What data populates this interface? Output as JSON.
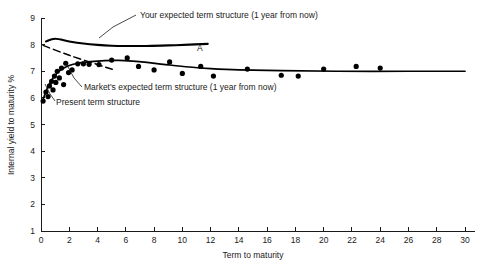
{
  "chart_data": {
    "type": "scatter",
    "title": "",
    "xlabel": "Term to maturity",
    "ylabel": "Internal yield to maturity %",
    "xlim": [
      0,
      30
    ],
    "ylim": [
      1,
      9
    ],
    "xticks": [
      0,
      2,
      4,
      6,
      8,
      10,
      12,
      14,
      16,
      18,
      20,
      22,
      24,
      26,
      28,
      30
    ],
    "yticks": [
      1,
      2,
      3,
      4,
      5,
      6,
      7,
      8,
      9
    ],
    "xtick_labels": [
      "0",
      "2",
      "4",
      "6",
      "8",
      "10",
      "12",
      "14",
      "16",
      "18",
      "20",
      "22",
      "24",
      "26",
      "28",
      "30"
    ],
    "ytick_labels": [
      "1",
      "2",
      "3",
      "4",
      "5",
      "6",
      "7",
      "8",
      "9"
    ],
    "grid": false,
    "legend_position": "inline-annotations",
    "scatter_points": [
      {
        "x": 0.15,
        "y": 5.88
      },
      {
        "x": 0.35,
        "y": 6.22
      },
      {
        "x": 0.5,
        "y": 6.05
      },
      {
        "x": 0.6,
        "y": 6.45
      },
      {
        "x": 0.75,
        "y": 6.62
      },
      {
        "x": 0.85,
        "y": 6.3
      },
      {
        "x": 0.95,
        "y": 6.82
      },
      {
        "x": 1.05,
        "y": 6.58
      },
      {
        "x": 1.15,
        "y": 7.0
      },
      {
        "x": 1.3,
        "y": 6.75
      },
      {
        "x": 1.45,
        "y": 7.12
      },
      {
        "x": 1.6,
        "y": 6.5
      },
      {
        "x": 1.75,
        "y": 7.3
      },
      {
        "x": 1.95,
        "y": 6.95
      },
      {
        "x": 2.2,
        "y": 7.05
      },
      {
        "x": 2.6,
        "y": 7.28
      },
      {
        "x": 3.0,
        "y": 7.28
      },
      {
        "x": 3.4,
        "y": 7.26
      },
      {
        "x": 4.1,
        "y": 7.25
      },
      {
        "x": 5.0,
        "y": 7.42
      },
      {
        "x": 6.1,
        "y": 7.5
      },
      {
        "x": 6.9,
        "y": 7.18
      },
      {
        "x": 8.0,
        "y": 7.05
      },
      {
        "x": 9.1,
        "y": 7.35
      },
      {
        "x": 10.0,
        "y": 6.92
      },
      {
        "x": 11.3,
        "y": 7.18
      },
      {
        "x": 12.2,
        "y": 6.82
      },
      {
        "x": 14.6,
        "y": 7.08
      },
      {
        "x": 17.0,
        "y": 6.85
      },
      {
        "x": 18.2,
        "y": 6.82
      },
      {
        "x": 20.0,
        "y": 7.08
      },
      {
        "x": 22.3,
        "y": 7.18
      },
      {
        "x": 24.0,
        "y": 7.12
      }
    ],
    "curves": [
      {
        "name": "your-expected-term-structure",
        "label": "Your expected term structure (1 year from now)",
        "style": "solid",
        "points": [
          {
            "x": 0.35,
            "y": 8.12
          },
          {
            "x": 1.0,
            "y": 8.22
          },
          {
            "x": 2.0,
            "y": 8.12
          },
          {
            "x": 3.0,
            "y": 8.04
          },
          {
            "x": 4.0,
            "y": 7.99
          },
          {
            "x": 5.0,
            "y": 7.96
          },
          {
            "x": 6.0,
            "y": 7.95
          },
          {
            "x": 7.5,
            "y": 7.95
          },
          {
            "x": 9.0,
            "y": 7.97
          },
          {
            "x": 10.5,
            "y": 8.0
          },
          {
            "x": 11.8,
            "y": 8.03
          }
        ]
      },
      {
        "name": "markets-expected-term-structure",
        "label": "Market's expected term structure (1 year from now)",
        "style": "solid",
        "points": [
          {
            "x": 0.15,
            "y": 5.95
          },
          {
            "x": 0.4,
            "y": 6.3
          },
          {
            "x": 0.7,
            "y": 6.62
          },
          {
            "x": 1.0,
            "y": 6.85
          },
          {
            "x": 1.4,
            "y": 7.05
          },
          {
            "x": 1.9,
            "y": 7.2
          },
          {
            "x": 2.6,
            "y": 7.3
          },
          {
            "x": 3.5,
            "y": 7.36
          },
          {
            "x": 4.5,
            "y": 7.4
          },
          {
            "x": 5.5,
            "y": 7.41
          },
          {
            "x": 6.5,
            "y": 7.38
          },
          {
            "x": 7.5,
            "y": 7.33
          },
          {
            "x": 9.0,
            "y": 7.24
          },
          {
            "x": 10.5,
            "y": 7.16
          },
          {
            "x": 12.0,
            "y": 7.1
          },
          {
            "x": 14.0,
            "y": 7.05
          },
          {
            "x": 17.0,
            "y": 7.02
          },
          {
            "x": 21.0,
            "y": 7.0
          },
          {
            "x": 26.0,
            "y": 7.0
          },
          {
            "x": 30.0,
            "y": 7.0
          }
        ]
      },
      {
        "name": "present-term-structure",
        "label": "Present term structure",
        "style": "dashed",
        "points": [
          {
            "x": 0.15,
            "y": 7.97
          },
          {
            "x": 2.0,
            "y": 7.6
          },
          {
            "x": 4.0,
            "y": 7.25
          },
          {
            "x": 5.2,
            "y": 7.05
          }
        ]
      }
    ],
    "annotations": [
      {
        "name": "label-your-expected",
        "text": "Your expected term structure (1 year from now)",
        "text_x": 140,
        "text_y": 18,
        "leader": [
          [
            136,
            15
          ],
          [
            113,
            27
          ],
          [
            99,
            38
          ]
        ]
      },
      {
        "name": "label-markets-expected",
        "text": "Market's expected term structure (1 year from now)",
        "text_x": 84,
        "text_y": 90,
        "leader": [
          [
            82,
            87
          ],
          [
            74,
            78
          ],
          [
            66,
            63
          ]
        ]
      },
      {
        "name": "label-present-term-structure",
        "text": "Present term structure",
        "text_x": 56,
        "text_y": 105,
        "leader": [
          [
            55,
            101
          ],
          [
            50,
            94
          ],
          [
            45,
            84
          ]
        ]
      },
      {
        "name": "label-point-a",
        "text": "A",
        "text_x": 197,
        "text_y": 51,
        "leader": []
      }
    ]
  }
}
